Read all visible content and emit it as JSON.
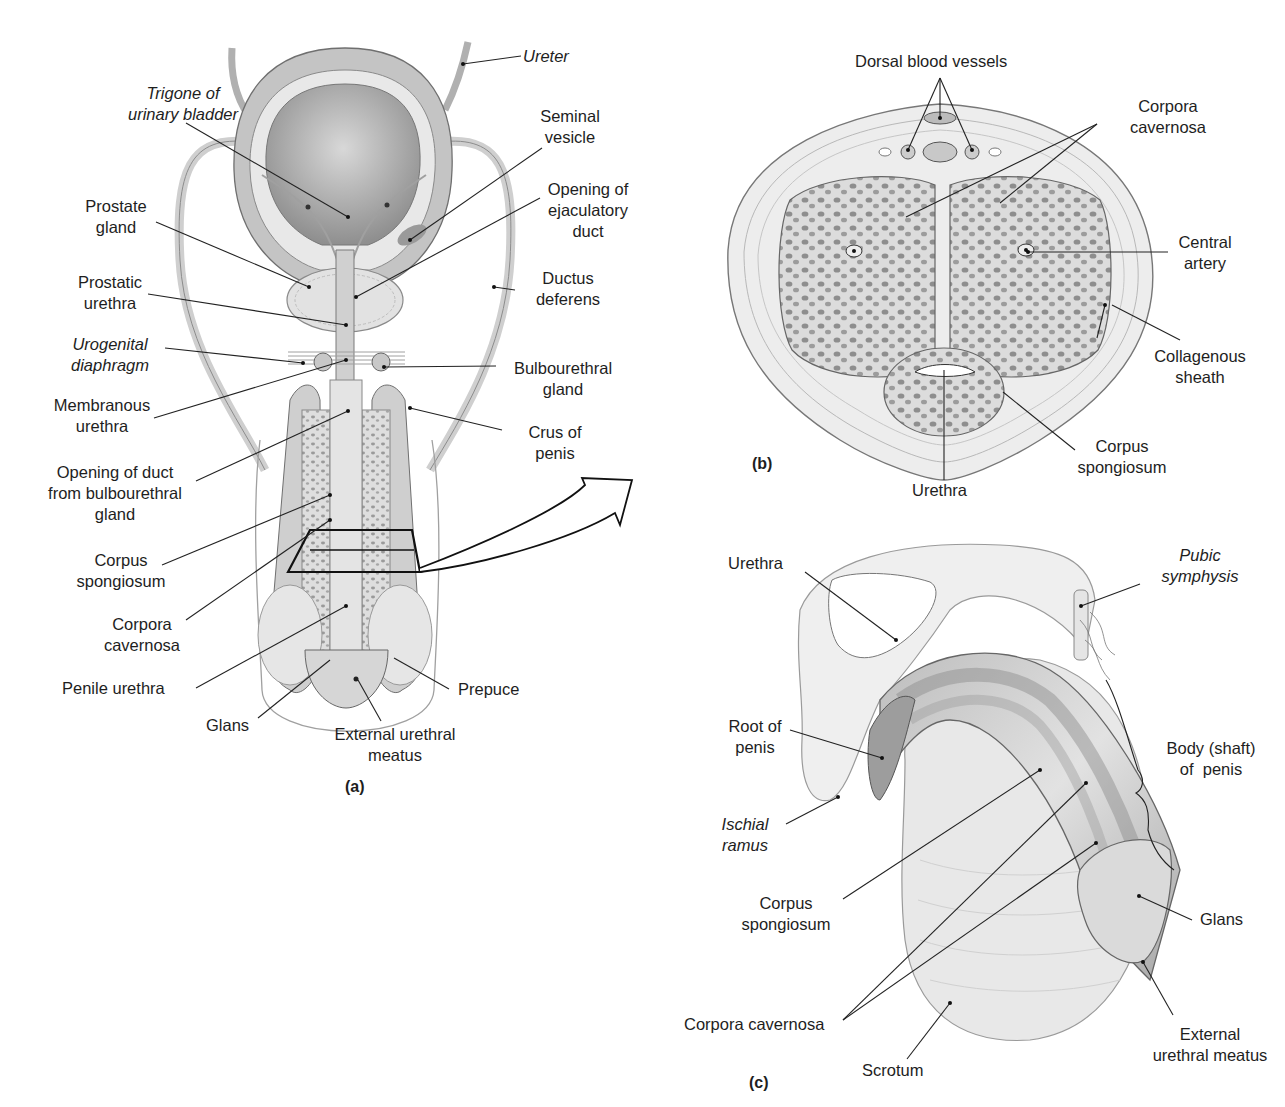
{
  "figure": {
    "title_fragment_visible": "",
    "panels": [
      {
        "id": "a",
        "letter": "(a)"
      },
      {
        "id": "b",
        "letter": "(b)"
      },
      {
        "id": "c",
        "letter": "(c)"
      }
    ]
  },
  "panel_a": {
    "labels": {
      "ureter": "Ureter",
      "trigone": [
        "Trigone of",
        "urinary bladder"
      ],
      "seminal_vesicle": [
        "Seminal",
        "vesicle"
      ],
      "prostate_gland": [
        "Prostate",
        "gland"
      ],
      "ejaculatory_duct": [
        "Opening of",
        "ejaculatory",
        "duct"
      ],
      "prostatic_urethra": [
        "Prostatic",
        "urethra"
      ],
      "ductus_deferens": [
        "Ductus",
        "deferens"
      ],
      "urogenital_diaphragm": [
        "Urogenital",
        "diaphragm"
      ],
      "bulbourethral_gland": [
        "Bulbourethral",
        "gland"
      ],
      "membranous_urethra": [
        "Membranous",
        "urethra"
      ],
      "crus_of_penis": [
        "Crus of",
        "penis"
      ],
      "opening_duct_bulbourethral": [
        "Opening of duct",
        "from bulbourethral",
        "gland"
      ],
      "corpus_spongiosum": [
        "Corpus",
        "spongiosum"
      ],
      "corpora_cavernosa": [
        "Corpora",
        "cavernosa"
      ],
      "penile_urethra": "Penile urethra",
      "prepuce": "Prepuce",
      "glans": "Glans",
      "external_urethral_meatus": [
        "External urethral",
        "meatus"
      ]
    }
  },
  "panel_b": {
    "labels": {
      "dorsal_blood_vessels": "Dorsal blood vessels",
      "corpora_cavernosa": [
        "Corpora",
        "cavernosa"
      ],
      "central_artery": [
        "Central",
        "artery"
      ],
      "collagenous_sheath": [
        "Collagenous",
        "sheath"
      ],
      "corpus_spongiosum": [
        "Corpus",
        "spongiosum"
      ],
      "urethra": "Urethra"
    }
  },
  "panel_c": {
    "labels": {
      "urethra": "Urethra",
      "pubic_symphysis": [
        "Pubic",
        "symphysis"
      ],
      "root_of_penis": [
        "Root of",
        "penis"
      ],
      "body_shaft": [
        "Body (shaft)",
        "of  penis"
      ],
      "ischial_ramus": [
        "Ischial",
        "ramus"
      ],
      "corpus_spongiosum": [
        "Corpus",
        "spongiosum"
      ],
      "glans": "Glans",
      "corpora_cavernosa": "Corpora cavernosa",
      "scrotum": "Scrotum",
      "external_urethral_meatus": [
        "External",
        "urethral meatus"
      ]
    }
  },
  "colors": {
    "line": "#222222",
    "tissue_light": "#e6e6e6",
    "tissue_mid": "#c9c9c9",
    "tissue_dark": "#9a9a9a",
    "cavity": "#b5b5b5"
  }
}
